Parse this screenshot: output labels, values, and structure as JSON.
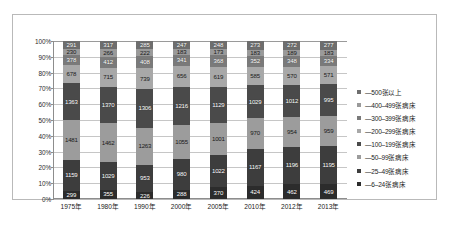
{
  "chart_data": {
    "type": "bar",
    "subtype": "stacked-percent",
    "title": "",
    "xlabel": "",
    "ylabel": "",
    "ylim": [
      0,
      100
    ],
    "ytick_labels": [
      "100%",
      "90%",
      "80%",
      "70%",
      "60%",
      "50%",
      "40%",
      "30%",
      "20%",
      "10%",
      "0%"
    ],
    "grid": true,
    "legend_position": "right",
    "categories": [
      "1975年",
      "1980年",
      "1990年",
      "2000年",
      "2005年",
      "2010年",
      "2012年",
      "2013年"
    ],
    "series": [
      {
        "name": "—500张以上",
        "color": "#6e6e6e",
        "values": [
          291,
          317,
          285,
          247,
          248,
          273,
          272,
          277
        ]
      },
      {
        "name": "—400–499张病床",
        "color": "#9a9a9a",
        "values": [
          230,
          266,
          222,
          183,
          173,
          183,
          189,
          183
        ]
      },
      {
        "name": "—300–399张病床",
        "color": "#7a7a7a",
        "values": [
          378,
          412,
          408,
          341,
          368,
          352,
          348,
          334
        ]
      },
      {
        "name": "—200–299张病床",
        "color": "#a8a8a8",
        "values": [
          678,
          715,
          739,
          656,
          619,
          585,
          570,
          571
        ]
      },
      {
        "name": "—100–199张病床",
        "color": "#4a4a4a",
        "values": [
          1363,
          1370,
          1306,
          1216,
          1129,
          1029,
          1012,
          995
        ]
      },
      {
        "name": "—50–99张病床",
        "color": "#9c9c9c",
        "values": [
          1481,
          1462,
          1263,
          1055,
          1001,
          970,
          954,
          959
        ]
      },
      {
        "name": "—25–49张病床",
        "color": "#3d3d3d",
        "values": [
          1159,
          1029,
          953,
          980,
          1022,
          1167,
          1196,
          1195
        ]
      },
      {
        "name": "—6–24张病床",
        "color": "#2c2c2c",
        "values": [
          299,
          355,
          226,
          288,
          370,
          424,
          462,
          469
        ]
      }
    ]
  },
  "legend": {
    "items": [
      {
        "label": "—500张以上"
      },
      {
        "label": "—400–499张病床"
      },
      {
        "label": "—300–399张病床"
      },
      {
        "label": "—200–299张病床"
      },
      {
        "label": "—100–199张病床"
      },
      {
        "label": "—50–99张病床"
      },
      {
        "label": "—25–49张病床"
      },
      {
        "label": "—6–24张病床"
      }
    ]
  }
}
